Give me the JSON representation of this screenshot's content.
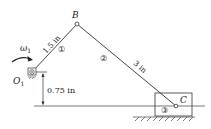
{
  "diagram": {
    "type": "slider-crank mechanism",
    "points": {
      "O1": {
        "label": "O",
        "subscript": "1"
      },
      "B": {
        "label": "B"
      },
      "C": {
        "label": "C"
      }
    },
    "links": [
      {
        "id": "1",
        "label": "①",
        "length_label": "1.5 in"
      },
      {
        "id": "2",
        "label": "②",
        "length_label": "3 in"
      },
      {
        "id": "3",
        "label": "③"
      }
    ],
    "angular_velocity": {
      "symbol": "ω",
      "subscript": "1"
    },
    "offset_dimension": "0.75 in",
    "colors": {
      "line": "#333333",
      "background": "#ffffff"
    }
  }
}
